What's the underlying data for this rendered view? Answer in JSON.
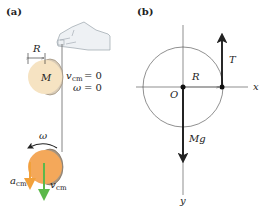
{
  "panels": {
    "a": {
      "label": "(a)",
      "radius_label": "R",
      "mass_label": "M",
      "initial": {
        "vcm_symbol": "v",
        "vcm_sub": "cm",
        "vcm_value": "= 0",
        "omega_symbol": "ω",
        "omega_value": "= 0"
      },
      "falling": {
        "omega_label": "ω",
        "acm_symbol": "a",
        "acm_sub": "cm",
        "vcm_symbol": "v",
        "vcm_sub": "cm"
      }
    },
    "b": {
      "label": "(b)",
      "tension_label": "T",
      "radius_label": "R",
      "origin_label": "O",
      "weight_label": "Mg",
      "x_axis_label": "x",
      "y_axis_label": "y"
    }
  },
  "colors": {
    "disk_light": "#f6e3c2",
    "disk_orange": "#f4a85a",
    "disk_edge": "#8a7a66",
    "acm_arrow": "#f2a13a",
    "vcm_arrow": "#5bb84a",
    "hand_fill": "#eef1f4",
    "hand_stroke": "#9aa3ab",
    "line": "#222222"
  }
}
